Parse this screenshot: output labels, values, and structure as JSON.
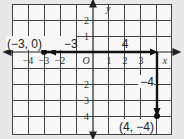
{
  "diagram": {
    "type": "coordinate-plane",
    "axes": {
      "x_label": "x",
      "y_label": "y",
      "origin_label": "O",
      "x_ticks": [
        "−4",
        "−3",
        "−2",
        "1",
        "2",
        "3"
      ],
      "y_ticks": [
        "2",
        "1",
        "−2",
        "−3",
        "−4"
      ]
    },
    "points": [
      {
        "label": "(−3, 0)",
        "x": -3,
        "y": 0
      },
      {
        "label": "(4, −4)",
        "x": 4,
        "y": -4
      }
    ],
    "segments": [
      {
        "from": [
          -3,
          0
        ],
        "to": [
          4,
          0
        ],
        "label": "4",
        "sublabel": "−3"
      },
      {
        "from": [
          4,
          0
        ],
        "to": [
          4,
          -4
        ],
        "label": "−4"
      }
    ],
    "colors": {
      "background": "#e8e8e8",
      "panel": "#f7f7f7",
      "grid": "#333333",
      "path": "#111111"
    }
  }
}
